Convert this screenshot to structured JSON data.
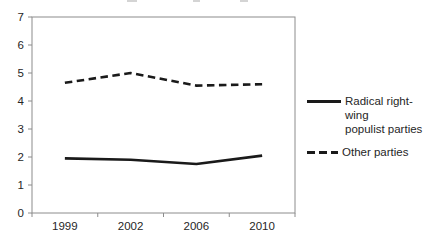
{
  "chart_data": {
    "type": "line",
    "title": "",
    "xlabel": "",
    "ylabel": "",
    "categories": [
      "1999",
      "2002",
      "2006",
      "2010"
    ],
    "series": [
      {
        "name": "Radical right-wing populist parties",
        "values": [
          1.95,
          1.9,
          1.75,
          2.05
        ],
        "line_style": "solid",
        "color": "#1a1a1a"
      },
      {
        "name": "Other parties",
        "values": [
          4.65,
          5.0,
          4.55,
          4.6
        ],
        "line_style": "dashed",
        "color": "#1a1a1a"
      }
    ],
    "ylim": [
      0,
      7
    ],
    "yticks": [
      0,
      1,
      2,
      3,
      4,
      5,
      6,
      7
    ],
    "grid": false,
    "legend_position": "right",
    "axis_color": "#8c8c8c",
    "text_color": "#262626"
  },
  "legend": {
    "items": [
      {
        "label_lines": [
          "Radical right-wing",
          "populist parties"
        ],
        "style": "solid"
      },
      {
        "label_lines": [
          "Other parties"
        ],
        "style": "dashed"
      }
    ]
  }
}
